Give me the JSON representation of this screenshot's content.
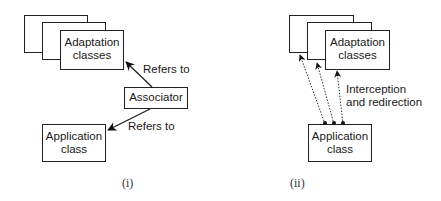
{
  "panel_i": {
    "adaptation_box": {
      "line1": "Adaptation",
      "line2": "classes"
    },
    "associator_box": "Associator",
    "application_box": {
      "line1": "Application",
      "line2": "class"
    },
    "arrow_to_adaptation_label": "Refers to",
    "arrow_to_application_label": "Refers to",
    "caption": "(i)"
  },
  "panel_ii": {
    "adaptation_box": {
      "line1": "Adaptation",
      "line2": "classes"
    },
    "application_box": {
      "line1": "Application",
      "line2": "class"
    },
    "arrows_label": {
      "line1": "Interception",
      "line2": "and redirection"
    },
    "caption": "(ii)"
  },
  "colors": {
    "stroke": "#222222",
    "background": "#ffffff"
  }
}
